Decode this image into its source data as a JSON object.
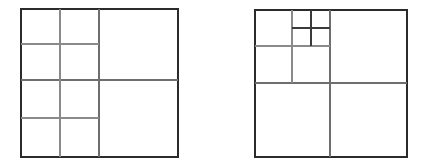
{
  "page": {
    "background_color": "#ffffff",
    "width": 426,
    "height": 166
  },
  "style": {
    "outer_border_color": "#2b2b2b",
    "outer_border_width": 2,
    "major_line_color": "#6e6e6e",
    "minor_line_color": "#8a8a8a",
    "fine_line_color": "#3a3a3a",
    "cell_fill": "#ffffff"
  },
  "figures": [
    {
      "name": "left-quadtree",
      "label": "",
      "bounds": {
        "x": 21,
        "y": 9,
        "width": 157,
        "height": 148
      },
      "root_split": {
        "x": 99,
        "y": 80
      },
      "description": "Square subdivided into four quadrants; both left quadrants each further split into four cells; right quadrants left whole.",
      "leaf_count": 10,
      "max_depth": 2,
      "lines": [
        {
          "name": "root-vertical",
          "x1": 99,
          "y1": 9,
          "x2": 99,
          "y2": 157,
          "weight": "major"
        },
        {
          "name": "root-horizontal",
          "x1": 21,
          "y1": 80,
          "x2": 178,
          "y2": 80,
          "weight": "major"
        },
        {
          "name": "top-left-vertical",
          "x1": 60,
          "y1": 9,
          "x2": 60,
          "y2": 80,
          "weight": "minor"
        },
        {
          "name": "top-left-horizontal",
          "x1": 21,
          "y1": 44,
          "x2": 99,
          "y2": 44,
          "weight": "minor"
        },
        {
          "name": "bottom-left-vertical",
          "x1": 60,
          "y1": 80,
          "x2": 60,
          "y2": 157,
          "weight": "minor"
        },
        {
          "name": "bottom-left-horizontal",
          "x1": 21,
          "y1": 118,
          "x2": 99,
          "y2": 118,
          "weight": "minor"
        }
      ],
      "cells": [
        {
          "name": "cell-tl-nw",
          "x": 21,
          "y": 9,
          "w": 39,
          "h": 35
        },
        {
          "name": "cell-tl-ne",
          "x": 60,
          "y": 9,
          "w": 39,
          "h": 35
        },
        {
          "name": "cell-tl-sw",
          "x": 21,
          "y": 44,
          "w": 39,
          "h": 36
        },
        {
          "name": "cell-tl-se",
          "x": 60,
          "y": 44,
          "w": 39,
          "h": 36
        },
        {
          "name": "cell-top-right",
          "x": 99,
          "y": 9,
          "w": 79,
          "h": 71
        },
        {
          "name": "cell-bl-nw",
          "x": 21,
          "y": 80,
          "w": 39,
          "h": 38
        },
        {
          "name": "cell-bl-ne",
          "x": 60,
          "y": 80,
          "w": 39,
          "h": 38
        },
        {
          "name": "cell-bl-sw",
          "x": 21,
          "y": 118,
          "w": 39,
          "h": 39
        },
        {
          "name": "cell-bl-se",
          "x": 60,
          "y": 118,
          "w": 39,
          "h": 39
        },
        {
          "name": "cell-bottom-right",
          "x": 99,
          "y": 80,
          "w": 79,
          "h": 77
        }
      ]
    },
    {
      "name": "right-quadtree",
      "label": "",
      "bounds": {
        "x": 255,
        "y": 10,
        "width": 152,
        "height": 147
      },
      "root_split": {
        "x": 330,
        "y": 83
      },
      "description": "Square subdivided into four quadrants; top-left quadrant split into four, and its top-right sub-cell split into four again; bottom half split vertically only.",
      "leaf_count": 9,
      "max_depth": 3,
      "lines": [
        {
          "name": "root-vertical",
          "x1": 330,
          "y1": 10,
          "x2": 330,
          "y2": 157,
          "weight": "major"
        },
        {
          "name": "root-horizontal",
          "x1": 255,
          "y1": 83,
          "x2": 407,
          "y2": 83,
          "weight": "major"
        },
        {
          "name": "top-left-vertical",
          "x1": 292,
          "y1": 10,
          "x2": 292,
          "y2": 83,
          "weight": "minor"
        },
        {
          "name": "top-left-horizontal",
          "x1": 255,
          "y1": 46,
          "x2": 330,
          "y2": 46,
          "weight": "minor"
        },
        {
          "name": "sub-vertical",
          "x1": 311,
          "y1": 10,
          "x2": 311,
          "y2": 46,
          "weight": "fine"
        },
        {
          "name": "sub-horizontal",
          "x1": 292,
          "y1": 28,
          "x2": 330,
          "y2": 28,
          "weight": "fine"
        }
      ],
      "cells": [
        {
          "name": "cell-tl-nw",
          "x": 255,
          "y": 10,
          "w": 37,
          "h": 36
        },
        {
          "name": "cell-tl-ne-nw",
          "x": 292,
          "y": 10,
          "w": 19,
          "h": 18
        },
        {
          "name": "cell-tl-ne-ne",
          "x": 311,
          "y": 10,
          "w": 19,
          "h": 18
        },
        {
          "name": "cell-tl-ne-sw",
          "x": 292,
          "y": 28,
          "w": 19,
          "h": 18
        },
        {
          "name": "cell-tl-ne-se",
          "x": 311,
          "y": 28,
          "w": 19,
          "h": 18
        },
        {
          "name": "cell-tl-sw",
          "x": 255,
          "y": 46,
          "w": 37,
          "h": 37
        },
        {
          "name": "cell-tl-se",
          "x": 292,
          "y": 46,
          "w": 38,
          "h": 37
        },
        {
          "name": "cell-top-right",
          "x": 330,
          "y": 10,
          "w": 77,
          "h": 73
        },
        {
          "name": "cell-bottom-left",
          "x": 255,
          "y": 83,
          "w": 75,
          "h": 74
        },
        {
          "name": "cell-bottom-right",
          "x": 330,
          "y": 83,
          "w": 77,
          "h": 74
        }
      ]
    }
  ]
}
